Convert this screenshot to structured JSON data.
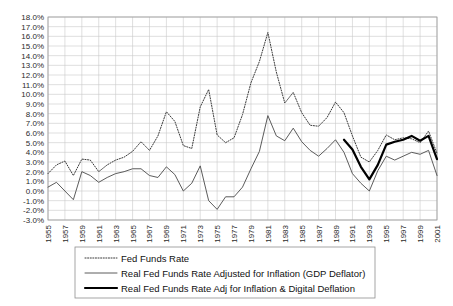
{
  "chart_data": {
    "type": "line",
    "title": "",
    "xlabel": "",
    "ylabel": "",
    "grid": true,
    "legend_position": "below-plot",
    "ylim": [
      -3.0,
      18.0
    ],
    "ytick_step": 1.0,
    "ytick_labels": [
      "18.0%",
      "17.0%",
      "16.0%",
      "15.0%",
      "14.0%",
      "13.0%",
      "12.0%",
      "11.0%",
      "10.0%",
      "9.0%",
      "8.0%",
      "7.0%",
      "6.0%",
      "5.0%",
      "4.0%",
      "3.0%",
      "2.0%",
      "1.0%",
      "0.0%",
      "-1.0%",
      "-2.0%",
      "-3.0%"
    ],
    "x": [
      1955,
      1956,
      1957,
      1958,
      1959,
      1960,
      1961,
      1962,
      1963,
      1964,
      1965,
      1966,
      1967,
      1968,
      1969,
      1970,
      1971,
      1972,
      1973,
      1974,
      1975,
      1976,
      1977,
      1978,
      1979,
      1980,
      1981,
      1982,
      1983,
      1984,
      1985,
      1986,
      1987,
      1988,
      1989,
      1990,
      1991,
      1992,
      1993,
      1994,
      1995,
      1996,
      1997,
      1998,
      1999,
      2000,
      2001
    ],
    "xtick_labels": [
      "1955",
      "1957",
      "1959",
      "1961",
      "1963",
      "1965",
      "1967",
      "1969",
      "1971",
      "1973",
      "1975",
      "1977",
      "1979",
      "1981",
      "1983",
      "1985",
      "1987",
      "1989",
      "1991",
      "1993",
      "1995",
      "1997",
      "1999",
      "2001"
    ],
    "series": [
      {
        "name": "Fed Funds Rate",
        "style": "dotted",
        "color": "#3a3a3a",
        "x": [
          1955,
          1956,
          1957,
          1958,
          1959,
          1960,
          1961,
          1962,
          1963,
          1964,
          1965,
          1966,
          1967,
          1968,
          1969,
          1970,
          1971,
          1972,
          1973,
          1974,
          1975,
          1976,
          1977,
          1978,
          1979,
          1980,
          1981,
          1982,
          1983,
          1984,
          1985,
          1986,
          1987,
          1988,
          1989,
          1990,
          1991,
          1992,
          1993,
          1994,
          1995,
          1996,
          1997,
          1998,
          1999,
          2000,
          2001
        ],
        "values": [
          1.8,
          2.7,
          3.1,
          1.6,
          3.3,
          3.2,
          2.0,
          2.7,
          3.2,
          3.5,
          4.1,
          5.1,
          4.2,
          5.7,
          8.2,
          7.2,
          4.7,
          4.4,
          8.7,
          10.5,
          5.8,
          5.0,
          5.5,
          7.9,
          11.2,
          13.4,
          16.4,
          12.3,
          9.1,
          10.2,
          8.1,
          6.8,
          6.7,
          7.6,
          9.2,
          8.1,
          5.7,
          3.5,
          3.0,
          4.2,
          5.8,
          5.3,
          5.5,
          5.4,
          5.0,
          6.2,
          3.9
        ]
      },
      {
        "name": "Real Fed Funds Rate Adjusted for Inflation (GDP Deflator)",
        "style": "solid-thin",
        "color": "#4a4a4a",
        "x": [
          1955,
          1956,
          1957,
          1958,
          1959,
          1960,
          1961,
          1962,
          1963,
          1964,
          1965,
          1966,
          1967,
          1968,
          1969,
          1970,
          1971,
          1972,
          1973,
          1974,
          1975,
          1976,
          1977,
          1978,
          1979,
          1980,
          1981,
          1982,
          1983,
          1984,
          1985,
          1986,
          1987,
          1988,
          1989,
          1990,
          1991,
          1992,
          1993,
          1994,
          1995,
          1996,
          1997,
          1998,
          1999,
          2000,
          2001
        ],
        "values": [
          0.4,
          0.9,
          0.0,
          -0.9,
          2.0,
          1.6,
          0.9,
          1.4,
          1.8,
          2.0,
          2.3,
          2.3,
          1.6,
          1.4,
          2.5,
          1.7,
          0.0,
          0.8,
          2.6,
          -1.0,
          -1.9,
          -0.6,
          -0.6,
          0.4,
          2.3,
          4.1,
          7.8,
          5.7,
          5.2,
          6.5,
          5.1,
          4.2,
          3.6,
          4.4,
          5.3,
          4.0,
          1.8,
          0.8,
          0.0,
          2.1,
          3.6,
          3.2,
          3.6,
          4.0,
          3.8,
          4.2,
          1.6
        ]
      },
      {
        "name": "Real Fed Funds Rate Adj for Inflation & Digital Deflation",
        "style": "solid-thick",
        "color": "#000000",
        "x": [
          1990,
          1991,
          1992,
          1993,
          1994,
          1995,
          1996,
          1997,
          1998,
          1999,
          2000,
          2001
        ],
        "values": [
          5.3,
          4.3,
          2.5,
          1.2,
          2.7,
          4.8,
          5.1,
          5.3,
          5.7,
          5.2,
          5.7,
          3.3
        ]
      }
    ]
  },
  "legend": {
    "items": [
      {
        "label": "Fed Funds Rate",
        "style": "dotted"
      },
      {
        "label": "Real Fed Funds Rate Adjusted for Inflation (GDP Deflator)",
        "style": "solid-thin"
      },
      {
        "label": "Real Fed Funds Rate Adj for Inflation & Digital Deflation",
        "style": "solid-thick"
      }
    ]
  }
}
